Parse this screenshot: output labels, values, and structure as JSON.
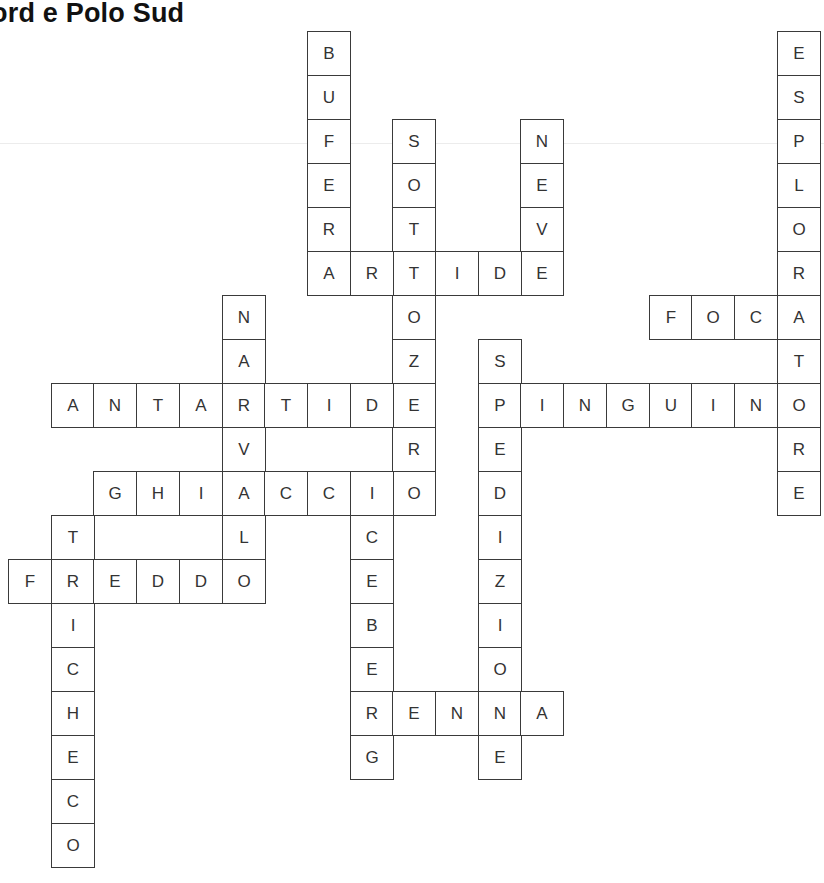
{
  "title": "ord e Polo Sud",
  "grid": {
    "origin_x": 8,
    "origin_y": 31,
    "cell_w": 42.7,
    "cell_h": 44
  },
  "words": [
    {
      "id": "bufera",
      "word": "BUFERA",
      "row": 0,
      "col": 7,
      "dir": "down"
    },
    {
      "id": "esploratore",
      "word": "ESPLORATORE",
      "row": 0,
      "col": 18,
      "dir": "down"
    },
    {
      "id": "sottozero",
      "word": "SOTTOZERO",
      "row": 2,
      "col": 9,
      "dir": "down"
    },
    {
      "id": "neve",
      "word": "NEVE",
      "row": 2,
      "col": 12,
      "dir": "down"
    },
    {
      "id": "artide",
      "word": "ARTIDE",
      "row": 5,
      "col": 7,
      "dir": "across"
    },
    {
      "id": "narvalo",
      "word": "NARVALO",
      "row": 6,
      "col": 5,
      "dir": "down"
    },
    {
      "id": "foca",
      "word": "FOCA",
      "row": 6,
      "col": 15,
      "dir": "across"
    },
    {
      "id": "spedizione",
      "word": "SPEDIZIONE",
      "row": 7,
      "col": 11,
      "dir": "down"
    },
    {
      "id": "antartide",
      "word": "ANTARTIDE",
      "row": 8,
      "col": 1,
      "dir": "across"
    },
    {
      "id": "pinguino",
      "word": "PINGUINO",
      "row": 8,
      "col": 11,
      "dir": "across"
    },
    {
      "id": "ghiaccio",
      "word": "GHIACCIO",
      "row": 10,
      "col": 2,
      "dir": "across"
    },
    {
      "id": "iceberg",
      "word": "ICEBERG",
      "row": 10,
      "col": 8,
      "dir": "down"
    },
    {
      "id": "tricheco",
      "word": "TRICHECO",
      "row": 11,
      "col": 1,
      "dir": "down"
    },
    {
      "id": "freddo",
      "word": "FREDDO",
      "row": 12,
      "col": 0,
      "dir": "across"
    },
    {
      "id": "renna",
      "word": "RENNA",
      "row": 15,
      "col": 8,
      "dir": "across"
    }
  ]
}
